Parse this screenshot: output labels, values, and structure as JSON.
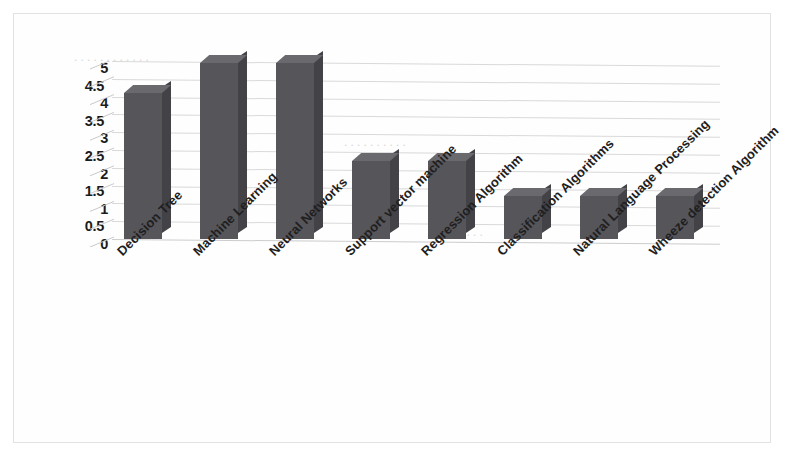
{
  "chart_data": {
    "type": "bar",
    "title": "",
    "subtitle": "",
    "xlabel": "",
    "ylabel": "",
    "ylim": [
      0,
      5
    ],
    "ytick_labels": [
      "5",
      "4.5",
      "4",
      "3.5",
      "3",
      "2.5",
      "2",
      "1.5",
      "1",
      "0.5",
      "0"
    ],
    "ytick_values": [
      5,
      4.5,
      4,
      3.5,
      3,
      2.5,
      2,
      1.5,
      1,
      0.5,
      0
    ],
    "grid": true,
    "legend": "none",
    "three_d": true,
    "bar_color": "#56555a",
    "categories": [
      "Decision Tree",
      "Machine Learning",
      "Neural Networks",
      "Support vector machine",
      "Regression Algorithm",
      "Classification Algorithms",
      "Natural Language Processing",
      "Wheeze detection Algorithm"
    ],
    "values": [
      4.1,
      4.95,
      4.95,
      2.2,
      2.2,
      1.2,
      1.2,
      1.2
    ]
  },
  "background_artifacts": [
    "scanned page",
    "faint show-through text",
    "light gray page border"
  ]
}
